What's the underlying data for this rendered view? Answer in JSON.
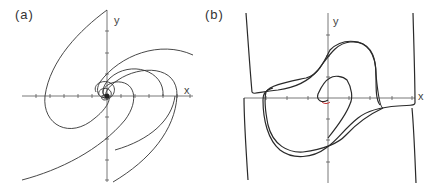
{
  "figure": {
    "panels": [
      {
        "label": "(a)",
        "x_axis_label": "x",
        "y_axis_label": "y",
        "description": "Phase portrait: trajectories spiralling into a stable focus at the origin"
      },
      {
        "label": "(b)",
        "x_axis_label": "x",
        "y_axis_label": "y",
        "description": "Phase portrait: relaxation oscillation with trajectories converging to a limit cycle"
      }
    ],
    "colors": {
      "curve": "#333333",
      "axis": "#555555",
      "highlight": "#cc3333"
    }
  }
}
